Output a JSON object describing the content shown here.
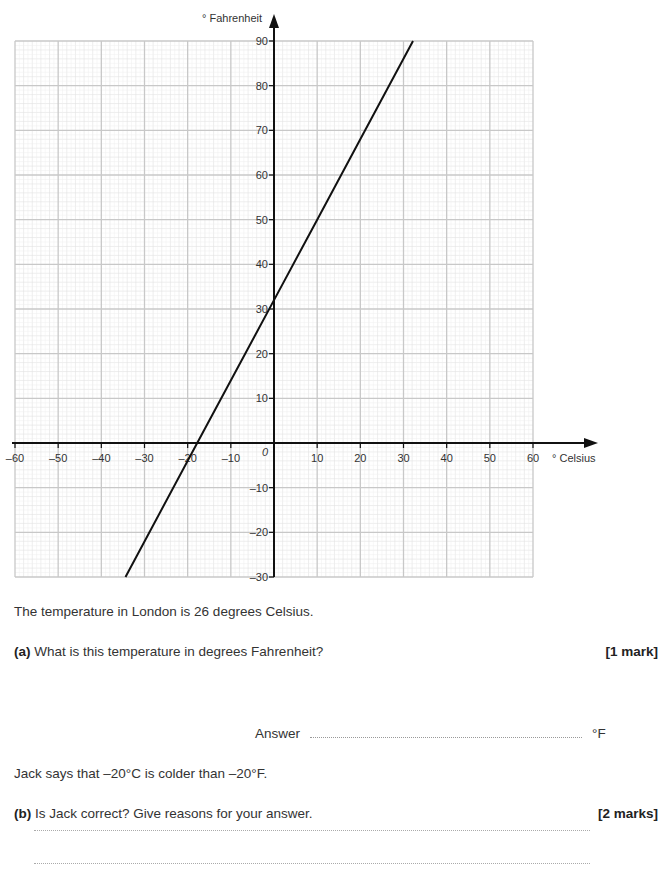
{
  "chart_data": {
    "type": "line",
    "title": "",
    "xlabel": "° Celsius",
    "ylabel": "° Fahrenheit",
    "xlim": [
      -60,
      60
    ],
    "ylim": [
      -30,
      90
    ],
    "x_ticks": [
      -60,
      -50,
      -40,
      -30,
      -20,
      -10,
      0,
      10,
      20,
      30,
      40,
      50,
      60
    ],
    "x_tick_labels": [
      "–60",
      "–50",
      "–40",
      "–30",
      "–20",
      "–10",
      "0",
      "10",
      "20",
      "30",
      "40",
      "50",
      "60"
    ],
    "y_ticks": [
      -30,
      -20,
      -10,
      10,
      20,
      30,
      40,
      50,
      60,
      70,
      80,
      90
    ],
    "y_tick_labels": [
      "–30",
      "–20",
      "–10",
      "10",
      "20",
      "30",
      "40",
      "50",
      "60",
      "70",
      "80",
      "90"
    ],
    "origin_label": "0",
    "grid": true,
    "grid_major_step": 10,
    "grid_minor_step": 2,
    "series": [
      {
        "name": "Celsius to Fahrenheit conversion",
        "x": [
          -34.4,
          -17.8,
          0,
          10,
          20,
          32.2
        ],
        "y": [
          -30,
          0,
          32,
          50,
          68,
          90
        ]
      }
    ],
    "legend": null
  },
  "question": {
    "intro": "The temperature in London is 26 degrees Celsius.",
    "part_a": {
      "label": "(a)",
      "text": "What is this temperature in degrees Fahrenheit?",
      "marks": "[1 mark]",
      "answer_label": "Answer",
      "answer_value": "",
      "answer_unit": "°F"
    },
    "statement": "Jack says that –20°C is colder than –20°F.",
    "part_b": {
      "label": "(b)",
      "text": "Is Jack correct? Give reasons for your answer.",
      "marks": "[2 marks]",
      "answer_lines": [
        "",
        ""
      ]
    }
  }
}
